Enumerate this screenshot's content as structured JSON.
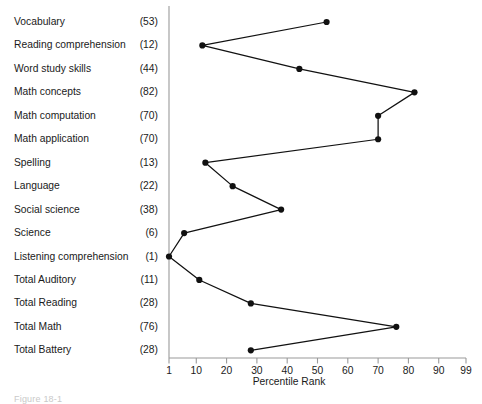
{
  "chart_data": {
    "type": "line",
    "title": "",
    "subtitle": "",
    "xlabel": "Percentile Rank",
    "ylabel": "",
    "orientation": "horizontal-profile",
    "grid": false,
    "legend": null,
    "xlim": [
      1,
      99
    ],
    "xticks": [
      1,
      10,
      20,
      30,
      40,
      50,
      60,
      70,
      80,
      90,
      99
    ],
    "xtick_labels": [
      "1",
      "10",
      "20",
      "30",
      "40",
      "50",
      "60",
      "70",
      "80",
      "90",
      "99"
    ],
    "categories": [
      "Vocabulary",
      "Reading comprehension",
      "Word study skills",
      "Math concepts",
      "Math computation",
      "Math application",
      "Spelling",
      "Language",
      "Social science",
      "Science",
      "Listening comprehension",
      "Total Auditory",
      "Total Reading",
      "Total Math",
      "Total Battery"
    ],
    "values": [
      53,
      12,
      44,
      82,
      70,
      70,
      13,
      22,
      38,
      6,
      1,
      11,
      28,
      76,
      28
    ],
    "value_labels": [
      "(53)",
      "(12)",
      "(44)",
      "(82)",
      "(70)",
      "(70)",
      "(13)",
      "(22)",
      "(38)",
      "(6)",
      "(1)",
      "(11)",
      "(28)",
      "(76)",
      "(28)"
    ],
    "marker": "filled-circle",
    "marker_color": "#111111",
    "line_color": "#111111"
  },
  "caption": {
    "text": "Figure 18-1"
  },
  "axis": {
    "x_title": "Percentile Rank"
  }
}
